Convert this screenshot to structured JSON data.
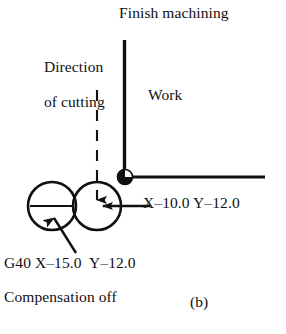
{
  "figure": {
    "panel_label": "(b)",
    "labels": {
      "finish_machining": "Finish machining",
      "direction_line1": "Direction",
      "direction_line2": "of cutting",
      "work": "Work",
      "tool_position": "X–10.0 Y–12.0",
      "g40_command": "G40 X–15.0  Y–12.0",
      "compensation_off": "Compensation off"
    },
    "colors": {
      "ink": "#101010",
      "background": "#ffffff"
    },
    "geometry": {
      "origin_marker": {
        "cx": 125,
        "cy": 177,
        "r": 7.5
      },
      "vertical_workpiece_edge": {
        "x": 124.5,
        "y_top": 40,
        "y_bottom": 177
      },
      "horizontal_workpiece_edge": {
        "y": 177,
        "x_left": 125,
        "x_right": 265
      },
      "tool_circle_start": {
        "cx": 52,
        "cy": 206,
        "r": 24
      },
      "tool_circle_end": {
        "cx": 97,
        "cy": 206,
        "r": 24
      },
      "cutting_direction_dashed_arrow": {
        "x": 97,
        "y_top": 90,
        "y_tip": 203
      },
      "retract_arrow": {
        "y": 206,
        "x_tail": 150,
        "x_tip": 99
      },
      "g40_leader_arrow": {
        "x_tail": 75,
        "y_tail": 252,
        "x_tip": 53,
        "y_tip": 211
      }
    }
  }
}
